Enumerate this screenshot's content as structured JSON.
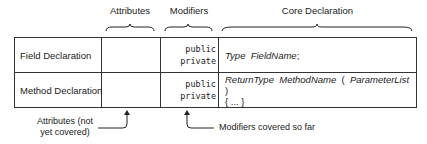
{
  "headers": {
    "attributes": "Attributes",
    "modifiers": "Modifiers",
    "core": "Core Declaration"
  },
  "rows": [
    {
      "label": "Field Declaration",
      "modifiers": [
        "public",
        "private"
      ],
      "core_line1": [
        "Type",
        "FieldName",
        ";"
      ],
      "core_line2": ""
    },
    {
      "label": "Method Declaration",
      "modifiers": [
        "public",
        "private"
      ],
      "core_line1": [
        "ReturnType",
        "MethodName",
        "(",
        "ParameterList",
        ")"
      ],
      "core_line2": "{ ... }"
    }
  ],
  "annotations": {
    "attributes_line1": "Attributes (not",
    "attributes_line2": "yet covered)",
    "modifiers": "Modifiers covered so far"
  }
}
